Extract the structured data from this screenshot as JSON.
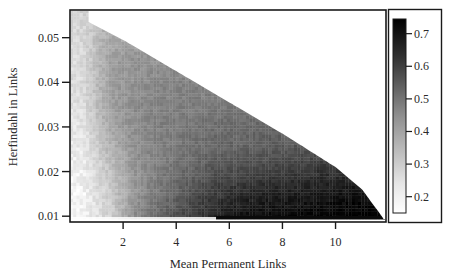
{
  "chart_data": {
    "type": "heatmap",
    "title": "",
    "xlabel": "Mean Permanent Links",
    "ylabel": "Herfindahl in Links",
    "xlim": [
      0,
      11.9
    ],
    "ylim": [
      0.0087,
      0.0562
    ],
    "x_ticks": [
      2,
      4,
      6,
      8,
      10
    ],
    "x_tick_labels": [
      "2",
      "4",
      "6",
      "8",
      "10"
    ],
    "y_ticks": [
      0.01,
      0.02,
      0.03,
      0.04,
      0.05
    ],
    "y_tick_labels": [
      "0.01",
      "0.02",
      "0.03",
      "0.04",
      "0.05"
    ],
    "grid": false,
    "colormap": "grayscale (white = low, black = high)",
    "colorbar": {
      "range": [
        0.15,
        0.745
      ],
      "ticks": [
        0.2,
        0.3,
        0.4,
        0.5,
        0.6,
        0.7
      ],
      "tick_labels": [
        "0.2",
        "0.3",
        "0.4",
        "0.5",
        "0.6",
        "0.7"
      ],
      "low_color": "#ffffff",
      "high_color": "#000000"
    },
    "data_region": {
      "shape": "triangle below diagonal",
      "upper_boundary": [
        [
          0.7,
          0.0535
        ],
        [
          2.0,
          0.0495
        ],
        [
          4.0,
          0.0425
        ],
        [
          6.0,
          0.0355
        ],
        [
          8.0,
          0.0285
        ],
        [
          10.0,
          0.021
        ],
        [
          11.0,
          0.016
        ],
        [
          11.8,
          0.0095
        ]
      ],
      "lower_boundary_y": 0.0095
    },
    "value_grid": {
      "x": [
        0.5,
        1.5,
        2.5,
        3.5,
        4.5,
        5.5,
        6.5,
        7.5,
        8.5,
        9.5,
        10.5,
        11.5
      ],
      "y": [
        0.0105,
        0.015,
        0.02,
        0.025,
        0.03,
        0.035,
        0.04,
        0.045,
        0.05
      ],
      "values": [
        [
          0.17,
          0.24,
          0.4,
          0.5,
          0.58,
          0.65,
          0.7,
          0.71,
          0.72,
          0.73,
          0.74,
          0.74
        ],
        [
          0.17,
          0.25,
          0.38,
          0.46,
          0.54,
          0.6,
          0.64,
          0.66,
          0.67,
          0.68,
          0.7,
          null
        ],
        [
          0.18,
          0.27,
          0.38,
          0.44,
          0.49,
          0.54,
          0.56,
          0.58,
          0.6,
          0.62,
          null,
          null
        ],
        [
          0.19,
          0.3,
          0.39,
          0.43,
          0.46,
          0.49,
          0.5,
          0.52,
          0.53,
          null,
          null,
          null
        ],
        [
          0.2,
          0.33,
          0.4,
          0.43,
          0.45,
          0.47,
          0.48,
          0.49,
          null,
          null,
          null,
          null
        ],
        [
          0.21,
          0.35,
          0.4,
          0.42,
          0.43,
          0.44,
          null,
          null,
          null,
          null,
          null,
          null
        ],
        [
          0.22,
          0.35,
          0.39,
          0.41,
          0.42,
          null,
          null,
          null,
          null,
          null,
          null,
          null
        ],
        [
          0.22,
          0.35,
          0.38,
          null,
          null,
          null,
          null,
          null,
          null,
          null,
          null,
          null
        ],
        [
          0.23,
          0.33,
          null,
          null,
          null,
          null,
          null,
          null,
          null,
          null,
          null,
          null
        ]
      ]
    }
  }
}
